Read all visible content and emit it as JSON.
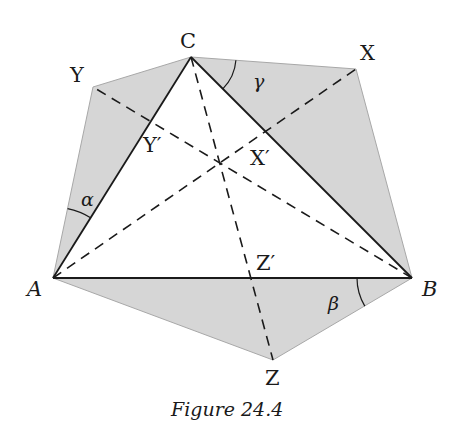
{
  "figure": {
    "caption": "Figure 24.4",
    "colors": {
      "shade": "#d6d6d6",
      "shade_edge": "#a8a8a8",
      "line": "#1a1a1a",
      "background": "#ffffff"
    },
    "points": {
      "A": {
        "label": "A",
        "x": 53,
        "y": 278
      },
      "B": {
        "label": "B",
        "x": 412,
        "y": 278
      },
      "C": {
        "label": "C",
        "x": 191,
        "y": 57
      },
      "X": {
        "label": "X",
        "x": 356,
        "y": 69
      },
      "Y": {
        "label": "Y",
        "x": 93,
        "y": 87
      },
      "Z": {
        "label": "Z",
        "x": 273,
        "y": 360
      },
      "X_prime": {
        "label": "X′",
        "x": 266,
        "y": 130
      },
      "Y_prime": {
        "label": "Y′",
        "x": 152,
        "y": 120
      },
      "Z_prime": {
        "label": "Z′",
        "x": 251,
        "y": 278
      },
      "center": {
        "x": 219,
        "y": 164
      }
    },
    "angles": {
      "alpha": "α",
      "beta": "β",
      "gamma": "γ"
    },
    "shaded_triangles": [
      "AYC",
      "CXB",
      "AZB"
    ],
    "solid_segments": [
      "AB",
      "BC",
      "CA"
    ],
    "dashed_segments": [
      "AX",
      "BY",
      "CZ"
    ]
  }
}
